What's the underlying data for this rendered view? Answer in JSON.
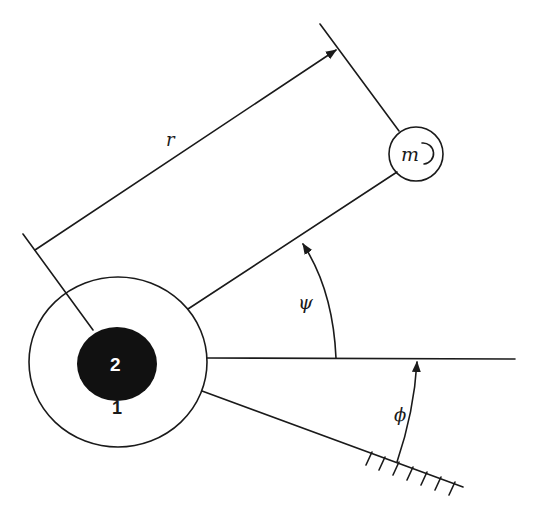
{
  "diagram": {
    "type": "mechanical schematic",
    "labels": {
      "radius": "r",
      "mass": "m",
      "angle_psi": "ψ",
      "angle_phi": "ϕ",
      "outer_body": "1",
      "inner_body": "2"
    },
    "colors": {
      "stroke": "#1a1a1a",
      "inner_body_fill": "#111111",
      "inner_body_text": "#ffffff",
      "background": "#ffffff"
    },
    "elements": [
      {
        "name": "outer-body-1",
        "shape": "circle",
        "label": "1"
      },
      {
        "name": "inner-body-2",
        "shape": "filled circle",
        "label": "2"
      },
      {
        "name": "mass-m",
        "shape": "circle",
        "label": "m"
      },
      {
        "name": "rod",
        "from": "outer-body-1",
        "to": "mass-m"
      },
      {
        "name": "dimension-r",
        "label": "r"
      },
      {
        "name": "reference-horizontal-line"
      },
      {
        "name": "ground-line",
        "hatched": true
      },
      {
        "name": "angle-psi",
        "between": [
          "reference-horizontal-line",
          "rod"
        ]
      },
      {
        "name": "angle-phi",
        "between": [
          "ground-line",
          "reference-horizontal-line"
        ]
      }
    ]
  }
}
